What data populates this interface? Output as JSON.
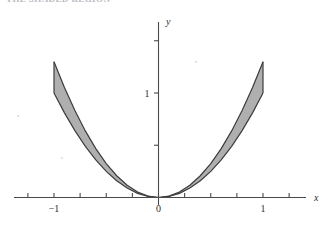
{
  "page": {
    "background_color": "#ffffff",
    "clipped_header_text": "THE SHADED REGION"
  },
  "chart_data": {
    "type": "area",
    "title": "",
    "xlabel": "x",
    "ylabel": "y",
    "xlim": [
      -1.35,
      1.35
    ],
    "ylim": [
      -0.18,
      1.9
    ],
    "grid": false,
    "legend": null,
    "axis_color": "#4a4a4a",
    "fill_color": "#a8a8a8",
    "curve_color": "#3c3c3c",
    "x_ticks": [
      {
        "value": -1.25,
        "label": ""
      },
      {
        "value": -1.0,
        "label": "-1"
      },
      {
        "value": -0.75,
        "label": ""
      },
      {
        "value": -0.5,
        "label": ""
      },
      {
        "value": -0.25,
        "label": ""
      },
      {
        "value": 0.0,
        "label": "0"
      },
      {
        "value": 0.25,
        "label": ""
      },
      {
        "value": 0.5,
        "label": ""
      },
      {
        "value": 0.75,
        "label": ""
      },
      {
        "value": 1.0,
        "label": "1"
      },
      {
        "value": 1.25,
        "label": ""
      }
    ],
    "y_ticks": [
      {
        "value": 0.5,
        "label": ""
      },
      {
        "value": 1.0,
        "label": "1"
      },
      {
        "value": 1.5,
        "label": ""
      }
    ],
    "series": [
      {
        "name": "upper-curve",
        "expression": "y = x^2",
        "x": [
          -1.0,
          -0.9,
          -0.8,
          -0.7,
          -0.6,
          -0.5,
          -0.4,
          -0.3,
          -0.2,
          -0.1,
          0.0,
          0.1,
          0.2,
          0.3,
          0.4,
          0.5,
          0.6,
          0.7,
          0.8,
          0.9,
          1.0
        ],
        "y": [
          1.3,
          1.053,
          0.832,
          0.637,
          0.468,
          0.325,
          0.208,
          0.117,
          0.052,
          0.013,
          0.0,
          0.013,
          0.052,
          0.117,
          0.208,
          0.325,
          0.468,
          0.637,
          0.832,
          1.053,
          1.3
        ]
      },
      {
        "name": "lower-curve",
        "expression": "y = x^4",
        "x": [
          -1.0,
          -0.9,
          -0.8,
          -0.7,
          -0.6,
          -0.5,
          -0.4,
          -0.3,
          -0.2,
          -0.1,
          0.0,
          0.1,
          0.2,
          0.3,
          0.4,
          0.5,
          0.6,
          0.7,
          0.8,
          0.9,
          1.0
        ],
        "y": [
          1.0,
          0.81,
          0.64,
          0.49,
          0.36,
          0.25,
          0.16,
          0.09,
          0.04,
          0.01,
          0.0,
          0.01,
          0.04,
          0.09,
          0.16,
          0.25,
          0.36,
          0.49,
          0.64,
          0.81,
          1.0
        ]
      }
    ],
    "shaded_region": {
      "name": "region-between-curves",
      "between": [
        "upper-curve",
        "lower-curve"
      ],
      "x_range": [
        -1.0,
        1.0
      ]
    }
  }
}
